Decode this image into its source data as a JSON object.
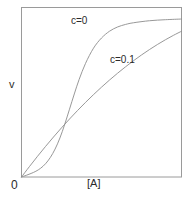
{
  "figure": {
    "background_color": "#ffffff",
    "frame_color": "#9a9a9a",
    "curve_color": "#8c8c8c",
    "text_color": "#2b2b2b"
  },
  "axes": {
    "y_label": "v",
    "x_label": "[A]",
    "origin_label": "0"
  },
  "annotations": {
    "curve_a_label": "c=0",
    "curve_b_label": "c=0.1"
  },
  "chart_data": {
    "type": "line",
    "title": "",
    "xlabel": "[A]",
    "ylabel": "v",
    "xlim": [
      0,
      1
    ],
    "ylim": [
      0,
      1
    ],
    "grid": false,
    "legend": "inline-annotations",
    "axis_tick_labels": {
      "x": [
        "0"
      ],
      "y": [
        "0"
      ]
    },
    "annotations": [
      {
        "text": "c=0",
        "x": 0.32,
        "y": 0.92
      },
      {
        "text": "c=0.1",
        "x": 0.55,
        "y": 0.7
      }
    ],
    "series": [
      {
        "name": "c=0",
        "description": "sigmoidal (cooperative) saturation curve, plateaus highest",
        "x": [
          0.0,
          0.03,
          0.06,
          0.09,
          0.12,
          0.15,
          0.18,
          0.21,
          0.24,
          0.27,
          0.3,
          0.33,
          0.36,
          0.4,
          0.45,
          0.5,
          0.55,
          0.6,
          0.65,
          0.7,
          0.8,
          0.9,
          1.0
        ],
        "y": [
          0.0,
          0.01,
          0.021,
          0.034,
          0.052,
          0.078,
          0.115,
          0.165,
          0.23,
          0.31,
          0.4,
          0.49,
          0.575,
          0.67,
          0.76,
          0.82,
          0.86,
          0.885,
          0.9,
          0.91,
          0.922,
          0.928,
          0.932
        ]
      },
      {
        "name": "c=0.1",
        "description": "hyperbolic (Michaelis-Menten) saturation curve, lower plateau",
        "x": [
          0.0,
          0.05,
          0.1,
          0.15,
          0.2,
          0.25,
          0.3,
          0.35,
          0.4,
          0.45,
          0.5,
          0.55,
          0.6,
          0.65,
          0.7,
          0.75,
          0.8,
          0.85,
          0.9,
          0.95,
          1.0
        ],
        "y": [
          0.0,
          0.062,
          0.122,
          0.18,
          0.236,
          0.29,
          0.342,
          0.392,
          0.44,
          0.486,
          0.53,
          0.572,
          0.612,
          0.65,
          0.686,
          0.72,
          0.752,
          0.782,
          0.81,
          0.836,
          0.86
        ]
      }
    ],
    "intersection": {
      "x": 0.325,
      "y": 0.47
    }
  }
}
